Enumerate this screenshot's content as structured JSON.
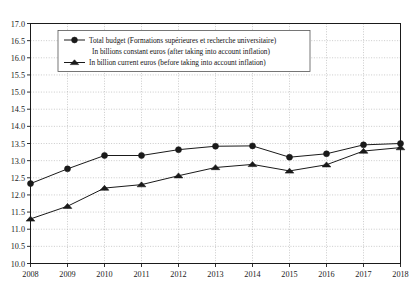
{
  "chart_data": {
    "type": "line",
    "title": "",
    "xlabel": "",
    "ylabel": "",
    "x": [
      2008,
      2009,
      2010,
      2011,
      2012,
      2013,
      2014,
      2015,
      2016,
      2017,
      2018
    ],
    "categories": [
      "2008",
      "2009",
      "2010",
      "2011",
      "2012",
      "2013",
      "2014",
      "2015",
      "2016",
      "2017",
      "2018"
    ],
    "series": [
      {
        "name": "Total budget (Formations supérieures et recherche universitaire) In billions constant euros (after taking into account inflation)",
        "marker": "circle",
        "values": [
          12.33,
          12.76,
          13.15,
          13.15,
          13.32,
          13.42,
          13.43,
          13.1,
          13.2,
          13.46,
          13.5
        ]
      },
      {
        "name": "In billion current euros (before taking into account inflation)",
        "marker": "triangle",
        "values": [
          11.3,
          11.67,
          12.2,
          12.3,
          12.56,
          12.8,
          12.89,
          12.7,
          12.88,
          13.28,
          13.38
        ]
      }
    ],
    "ylim": [
      10.0,
      17.0
    ],
    "ytick_step": 0.5,
    "ytick_labels": [
      "17.0",
      "16.5",
      "16.0",
      "15.5",
      "15.0",
      "14.5",
      "14.0",
      "13.5",
      "13.0",
      "12.5",
      "12.0",
      "11.5",
      "11.0",
      "10.5",
      "10.0"
    ],
    "xlim": [
      2008,
      2018
    ],
    "grid": true,
    "grid_style": "dotted",
    "legend_position": "top-left",
    "line_color": "#1a1a1a",
    "grid_color": "#b4b4b4",
    "axis_color": "#1a1a1a",
    "background": "#ffffff"
  },
  "legend": {
    "entries": [
      {
        "marker": "circle",
        "line1": "Total budget (Formations supérieures et recherche universitaire)",
        "line2": "In billions constant euros (after taking into account inflation)"
      },
      {
        "marker": "triangle",
        "line1": "In billion current euros (before taking into account inflation)",
        "line2": ""
      }
    ]
  },
  "caption": {
    "text": ""
  }
}
